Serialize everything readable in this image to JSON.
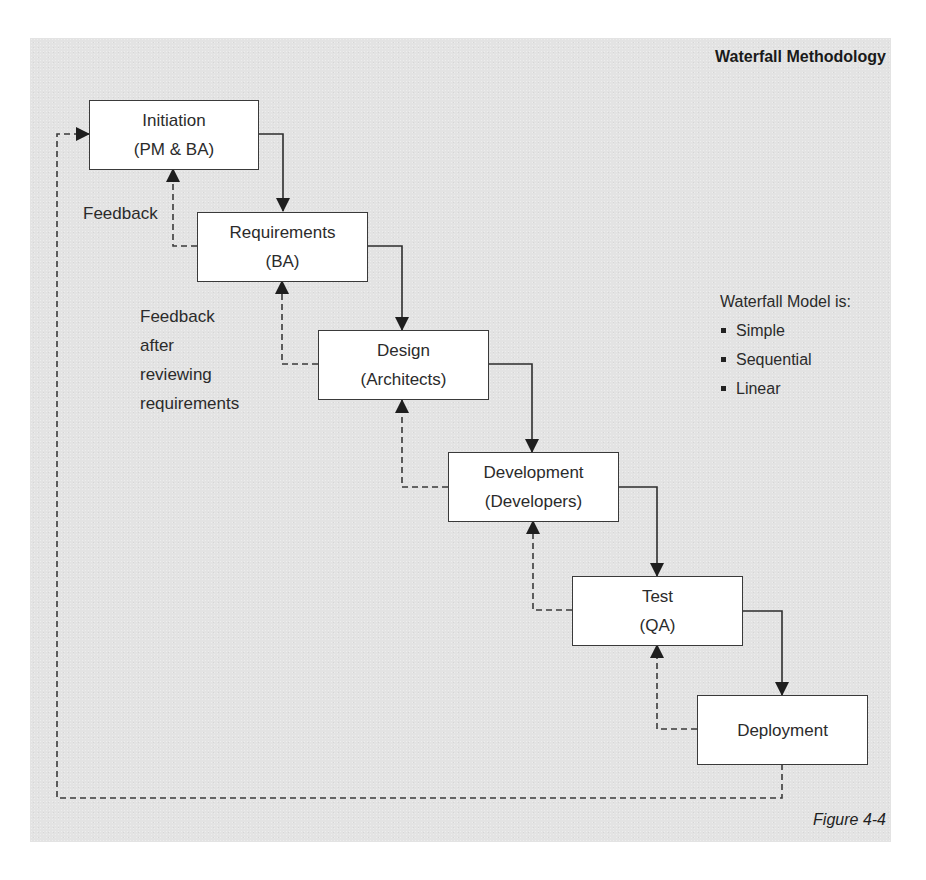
{
  "diagram": {
    "title": "Waterfall Methodology",
    "caption": "Figure 4-4",
    "colors": {
      "background": "#e3e3e3",
      "box_fill": "#ffffff",
      "line": "#3a3a3a",
      "text": "#2b2b2b"
    },
    "phases": [
      {
        "id": "initiation",
        "name": "Initiation",
        "role": "(PM & BA)"
      },
      {
        "id": "requirements",
        "name": "Requirements",
        "role": "(BA)"
      },
      {
        "id": "design",
        "name": "Design",
        "role": "(Architects)"
      },
      {
        "id": "development",
        "name": "Development",
        "role": "(Developers)"
      },
      {
        "id": "test",
        "name": "Test",
        "role": "(QA)"
      },
      {
        "id": "deployment",
        "name": "Deployment",
        "role": ""
      }
    ],
    "annotations": {
      "feedback": "Feedback",
      "feedback_after_review": [
        "Feedback",
        "after",
        "reviewing",
        "requirements"
      ]
    },
    "legend": {
      "heading": "Waterfall Model is:",
      "items": [
        "Simple",
        "Sequential",
        "Linear"
      ]
    },
    "connectors": {
      "forward": "solid arrows flowing down from each phase to the next",
      "feedback": "dashed arrows returning from each phase to the previous; dashed loop from Deployment back to Initiation"
    }
  }
}
